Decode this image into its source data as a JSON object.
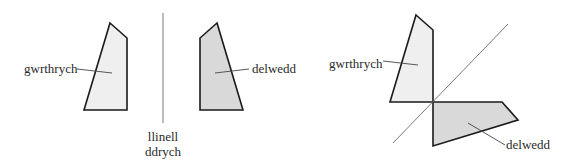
{
  "colors": {
    "object_fill": "#efefef",
    "image_fill": "#d9d9d9",
    "outline": "#1a1a1a",
    "mirror_line": "#7a7a7a",
    "leader_line": "#444444",
    "text": "#2a2a2a"
  },
  "left_panel": {
    "object_label": "gwrthrych",
    "image_label": "delwedd",
    "mirror_label_line1": "llinell",
    "mirror_label_line2": "ddrych"
  },
  "right_panel": {
    "object_label": "gwrthrych",
    "image_label": "delwedd"
  }
}
